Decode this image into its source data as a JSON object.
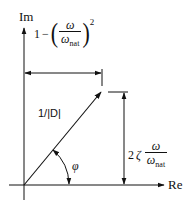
{
  "diagram": {
    "type": "complex-plane phasor diagram",
    "axes": {
      "imaginary_label": "Im",
      "real_label": "Re"
    },
    "vector": {
      "label": "1/|D|"
    },
    "angle": {
      "label": "φ"
    },
    "real_part_dimension": {
      "constant": "1",
      "minus": "−",
      "open_paren": "(",
      "close_paren": ")",
      "numerator": "ω",
      "denominator_symbol": "ω",
      "denominator_subscript": "nat",
      "exponent": "2"
    },
    "imaginary_part_dimension": {
      "coefficient": "2",
      "zeta": "ζ",
      "numerator": "ω",
      "denominator_symbol": "ω",
      "denominator_subscript": "nat"
    },
    "colors": {
      "line": "#111111",
      "background": "#ffffff"
    }
  }
}
